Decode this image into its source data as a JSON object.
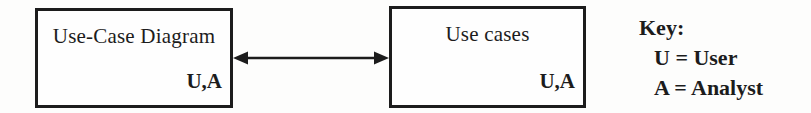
{
  "diagram": {
    "boxes": [
      {
        "label": "Use-Case Diagram",
        "roles": "U,A"
      },
      {
        "label": "Use cases",
        "roles": "U,A"
      }
    ],
    "connector": {
      "type": "double-headed-arrow"
    }
  },
  "key": {
    "title": "Key:",
    "entries": [
      "U = User",
      "A = Analyst"
    ]
  },
  "colors": {
    "ink": "#1c1c1c",
    "background": "#ffffff"
  }
}
